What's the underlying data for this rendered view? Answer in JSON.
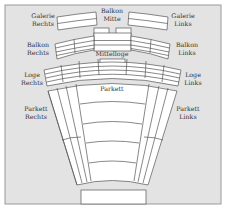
{
  "diagram": {
    "type": "theater-seating-plan",
    "colors": {
      "background": "#e3e3e3",
      "frame": "#9a9a9a",
      "block_fill": "#ffffff",
      "block_stroke": "#555555",
      "text": "#333333"
    },
    "sections": {
      "galerie_rechts": {
        "line1": "Galerie",
        "line2": "Rechts"
      },
      "balkon_mitte": {
        "line1": "Balkon",
        "line2": "Mitte"
      },
      "galerie_links": {
        "line1": "Galerie",
        "line2": "Links"
      },
      "balkon_rechts": {
        "line1": "Balkon",
        "line2": "Rechts"
      },
      "mittelloge": {
        "line1": "Mittelloge"
      },
      "balkon_links": {
        "line1": "Balkon",
        "line2": "Links"
      },
      "loge_rechts": {
        "line1": "Loge",
        "line2": "Rechts"
      },
      "loge_links": {
        "line1": "Loge",
        "line2": "Links"
      },
      "parkett": {
        "line1": "Parkett"
      },
      "parkett_rechts": {
        "line1": "Parkett",
        "line2": "Rechts"
      },
      "parkett_links": {
        "line1": "Parkett",
        "line2": "Links"
      }
    },
    "stage_label": ""
  }
}
